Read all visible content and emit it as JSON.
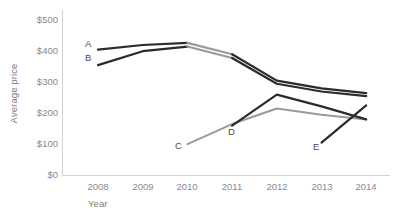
{
  "chart_data": {
    "type": "line",
    "title": "",
    "xlabel": "Year",
    "ylabel": "Average price",
    "categories": [
      2008,
      2009,
      2010,
      2011,
      2012,
      2013,
      2014
    ],
    "x": [
      2008,
      2009,
      2010,
      2011,
      2012,
      2013,
      2014
    ],
    "xlim": [
      2007.2,
      2014.6
    ],
    "ylim": [
      0,
      500
    ],
    "ytick_labels": [
      "$500",
      "$400",
      "$300",
      "$200",
      "$100",
      "$0"
    ],
    "ytick_values": [
      500,
      400,
      300,
      200,
      100,
      0
    ],
    "xtick_labels": [
      "2008",
      "2009",
      "2010",
      "2011",
      "2012",
      "2013",
      "2014"
    ],
    "grid": false,
    "legend": "inline-labels",
    "series": [
      {
        "name": "A",
        "label": "A",
        "color": "#2b2b2b",
        "x": [
          2008,
          2009,
          2010,
          2011,
          2012,
          2013,
          2014
        ],
        "values": [
          405,
          420,
          427,
          390,
          305,
          280,
          265
        ]
      },
      {
        "name": "B",
        "label": "B",
        "color": "#2b2b2b",
        "x": [
          2008,
          2009,
          2010,
          2011,
          2012,
          2013,
          2014
        ],
        "values": [
          355,
          400,
          415,
          378,
          295,
          270,
          255
        ]
      },
      {
        "name": "C",
        "label": "C",
        "color": "#9a9a9a",
        "x": [
          2010,
          2011,
          2012,
          2013,
          2014
        ],
        "values": [
          100,
          165,
          215,
          195,
          180
        ]
      },
      {
        "name": "D",
        "label": "D",
        "color": "#2b2b2b",
        "x": [
          2011,
          2012,
          2013,
          2014
        ],
        "values": [
          160,
          260,
          222,
          180
        ]
      },
      {
        "name": "E",
        "label": "E",
        "color": "#2b2b2b",
        "x": [
          2013,
          2014
        ],
        "values": [
          105,
          225
        ]
      }
    ],
    "annotations": [
      {
        "text": "A",
        "x_px": 85,
        "y_px": 44
      },
      {
        "text": "B",
        "x_px": 85,
        "y_px": 58
      },
      {
        "text": "C",
        "x_px": 175,
        "y_px": 146
      },
      {
        "text": "D",
        "x_px": 228,
        "y_px": 132
      },
      {
        "text": "E",
        "x_px": 313,
        "y_px": 147
      }
    ],
    "colors": {
      "axis": "#d2d2d2",
      "tick_text": "#8a8a8a",
      "axis_title": "#7d7d7d",
      "dark_line": "#2b2b2b",
      "light_line": "#9a9a9a",
      "background": "#ffffff"
    }
  }
}
